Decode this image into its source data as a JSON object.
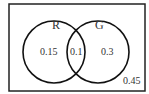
{
  "diagram": {
    "type": "venn",
    "sets": [
      {
        "label": "R"
      },
      {
        "label": "G"
      }
    ],
    "regions": {
      "r_only": "0.15",
      "intersection": "0.1",
      "g_only": "0.3",
      "outside": "0.45"
    },
    "colors": {
      "stroke": "#111111",
      "text": "#333333",
      "background": "#ffffff"
    }
  }
}
